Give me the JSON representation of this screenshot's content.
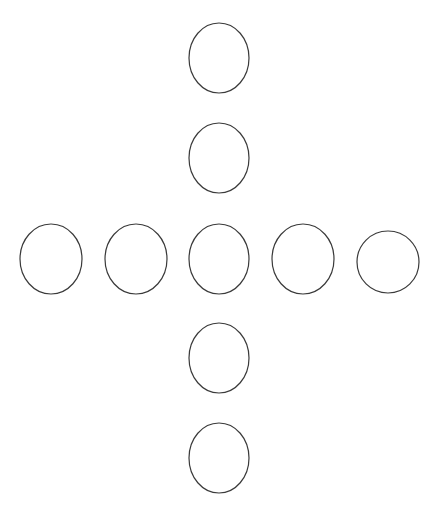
{
  "diagram": {
    "background": "#ffffff",
    "stroke_color": "#3a3a3a",
    "stroke_width": 1.2,
    "layout": "cross",
    "shapes": [
      {
        "id": "top-1",
        "type": "ellipse",
        "cx": 219,
        "cy": 58,
        "rx": 30,
        "ry": 35
      },
      {
        "id": "top-2",
        "type": "ellipse",
        "cx": 219,
        "cy": 158,
        "rx": 30,
        "ry": 35
      },
      {
        "id": "mid-1",
        "type": "ellipse",
        "cx": 51,
        "cy": 259,
        "rx": 31,
        "ry": 35
      },
      {
        "id": "mid-2",
        "type": "ellipse",
        "cx": 136,
        "cy": 259,
        "rx": 31,
        "ry": 35
      },
      {
        "id": "center",
        "type": "ellipse",
        "cx": 219,
        "cy": 259,
        "rx": 30,
        "ry": 35
      },
      {
        "id": "mid-4",
        "type": "ellipse",
        "cx": 303,
        "cy": 259,
        "rx": 31,
        "ry": 35
      },
      {
        "id": "mid-5",
        "type": "circle",
        "cx": 388,
        "cy": 262,
        "rx": 31,
        "ry": 31
      },
      {
        "id": "bottom-1",
        "type": "ellipse",
        "cx": 219,
        "cy": 358,
        "rx": 30,
        "ry": 35
      },
      {
        "id": "bottom-2",
        "type": "ellipse",
        "cx": 219,
        "cy": 458,
        "rx": 30,
        "ry": 35
      }
    ]
  }
}
